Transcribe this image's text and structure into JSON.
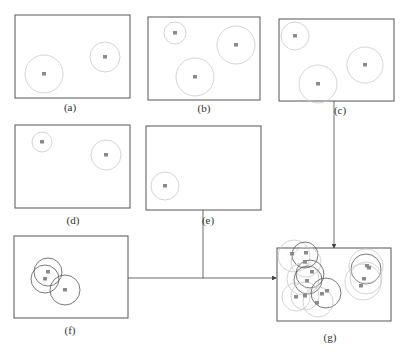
{
  "diagram": {
    "colors": {
      "frame": "#555555",
      "circle_light": "#c8c8c8",
      "circle_dark": "#555555",
      "point": "#8a8a8a",
      "arrow": "#444444"
    },
    "panels": [
      {
        "id": "a",
        "label": "(a)",
        "box": [
          15,
          15,
          115,
          83
        ],
        "label_pos": [
          70,
          111
        ],
        "circles": [
          {
            "cx": 44,
            "cy": 74,
            "r": 19,
            "dark": false
          },
          {
            "cx": 105,
            "cy": 57,
            "r": 15,
            "dark": false
          }
        ]
      },
      {
        "id": "b",
        "label": "(b)",
        "box": [
          148,
          17,
          112,
          83
        ],
        "label_pos": [
          204,
          112
        ],
        "circles": [
          {
            "cx": 175,
            "cy": 33,
            "r": 11,
            "dark": false
          },
          {
            "cx": 236,
            "cy": 45,
            "r": 19,
            "dark": false
          },
          {
            "cx": 195,
            "cy": 77,
            "r": 19,
            "dark": false
          }
        ]
      },
      {
        "id": "c",
        "label": "(c)",
        "box": [
          279,
          19,
          115,
          82
        ],
        "label_pos": [
          340,
          114
        ],
        "circles": [
          {
            "cx": 295,
            "cy": 36,
            "r": 14,
            "dark": false
          },
          {
            "cx": 318,
            "cy": 84,
            "r": 19,
            "dark": false
          },
          {
            "cx": 365,
            "cy": 65,
            "r": 18,
            "dark": false
          }
        ]
      },
      {
        "id": "d",
        "label": "(d)",
        "box": [
          15,
          125,
          115,
          83
        ],
        "label_pos": [
          73,
          224
        ],
        "circles": [
          {
            "cx": 42,
            "cy": 142,
            "r": 10,
            "dark": false
          },
          {
            "cx": 106,
            "cy": 155,
            "r": 15,
            "dark": false
          }
        ]
      },
      {
        "id": "e",
        "label": "(e)",
        "box": [
          146,
          126,
          115,
          84
        ],
        "label_pos": [
          208,
          224
        ],
        "circles": [
          {
            "cx": 165,
            "cy": 186,
            "r": 14,
            "dark": false
          }
        ]
      },
      {
        "id": "f",
        "label": "(f)",
        "box": [
          14,
          236,
          114,
          82
        ],
        "label_pos": [
          70,
          334
        ],
        "circles": [
          {
            "cx": 48,
            "cy": 272,
            "r": 14,
            "dark": true
          },
          {
            "cx": 45,
            "cy": 279,
            "r": 14,
            "dark": true
          },
          {
            "cx": 65,
            "cy": 290,
            "r": 15,
            "dark": true
          }
        ]
      },
      {
        "id": "g",
        "label": "(g)",
        "box": [
          277,
          248,
          114,
          73
        ],
        "label_pos": [
          330,
          341
        ],
        "circles": [
          {
            "cx": 294,
            "cy": 256,
            "r": 16,
            "dark": false
          },
          {
            "cx": 305,
            "cy": 255,
            "r": 13,
            "dark": true
          },
          {
            "cx": 306,
            "cy": 262,
            "r": 15,
            "dark": false
          },
          {
            "cx": 310,
            "cy": 274,
            "r": 14,
            "dark": true
          },
          {
            "cx": 308,
            "cy": 280,
            "r": 14,
            "dark": true
          },
          {
            "cx": 303,
            "cy": 279,
            "r": 16,
            "dark": false
          },
          {
            "cx": 296,
            "cy": 297,
            "r": 14,
            "dark": false
          },
          {
            "cx": 305,
            "cy": 296,
            "r": 14,
            "dark": false
          },
          {
            "cx": 326,
            "cy": 293,
            "r": 15,
            "dark": true
          },
          {
            "cx": 318,
            "cy": 302,
            "r": 15,
            "dark": false
          },
          {
            "cx": 366,
            "cy": 269,
            "r": 15,
            "dark": true
          },
          {
            "cx": 366,
            "cy": 266,
            "r": 17,
            "dark": false
          },
          {
            "cx": 366,
            "cy": 278,
            "r": 16,
            "dark": false
          },
          {
            "cx": 363,
            "cy": 282,
            "r": 18,
            "dark": false
          }
        ],
        "points": [
          [
            292,
            254
          ],
          [
            306,
            253
          ],
          [
            305,
            262
          ],
          [
            312,
            272
          ],
          [
            307,
            281
          ],
          [
            296,
            297
          ],
          [
            305,
            296
          ],
          [
            327,
            291
          ],
          [
            322,
            294
          ],
          [
            317,
            303
          ],
          [
            367,
            266
          ],
          [
            369,
            268
          ],
          [
            364,
            279
          ],
          [
            361,
            286
          ]
        ]
      }
    ],
    "connectors": [
      {
        "id": "c-to-g",
        "points": [
          [
            334,
            101
          ],
          [
            334,
            248
          ]
        ],
        "arrow": true
      },
      {
        "id": "e-to-join",
        "points": [
          [
            203,
            210
          ],
          [
            203,
            278
          ]
        ],
        "arrow": false
      },
      {
        "id": "f-to-g",
        "points": [
          [
            128,
            278
          ],
          [
            276,
            278
          ]
        ],
        "arrow": true
      }
    ]
  }
}
